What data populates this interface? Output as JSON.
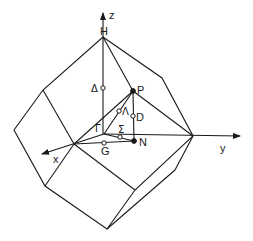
{
  "diagram": {
    "axes": {
      "x": "x",
      "y": "y",
      "z": "z"
    },
    "points": {
      "H": "H",
      "P": "P",
      "N": "N",
      "Gamma": "Γ"
    },
    "lines": {
      "Delta": "Δ",
      "Lambda": "Λ",
      "Sigma": "Σ",
      "D": "D",
      "G": "G"
    },
    "colors": {
      "ink": "#1a1a1a",
      "background": "#ffffff"
    }
  }
}
